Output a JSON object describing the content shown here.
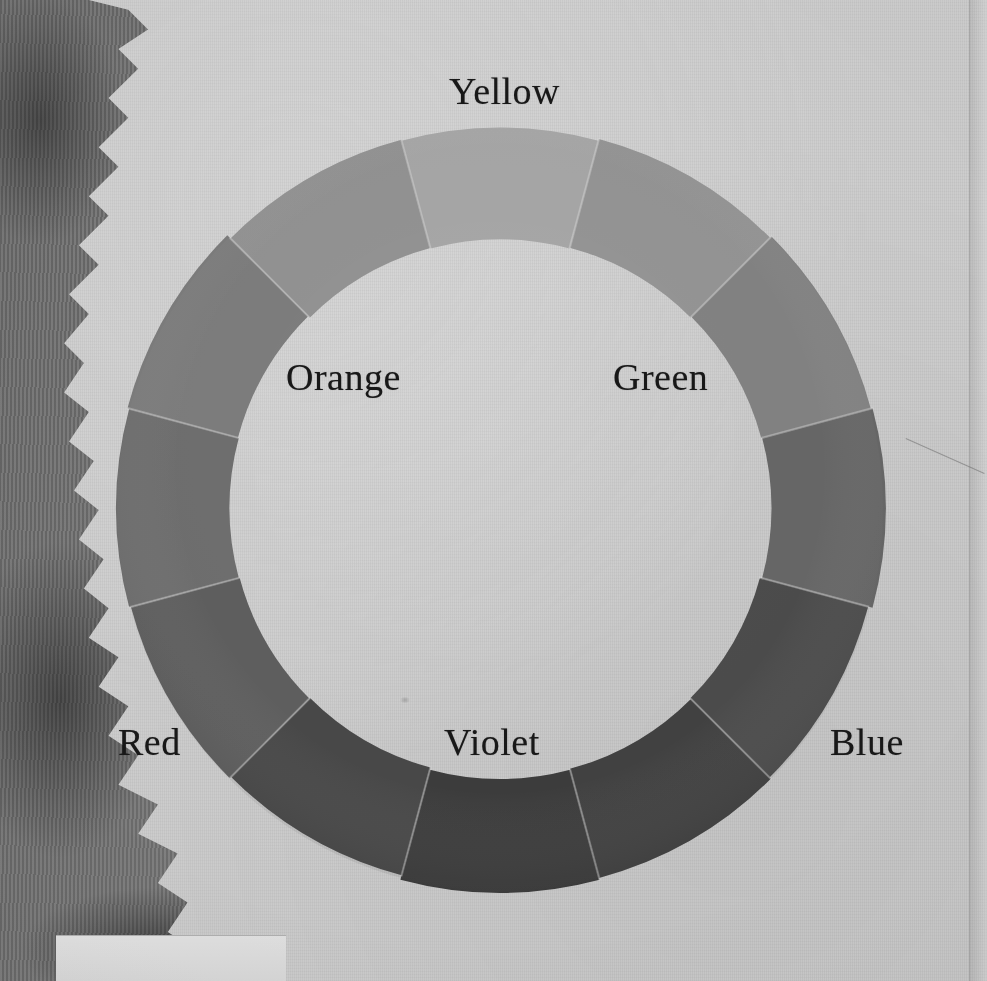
{
  "plate": {
    "title": "Color Wheel",
    "medium": "painted swatch ring on textured paper",
    "paper_color": "#d2d2d2",
    "underlayer_color": "#7a7a7a",
    "ink_color": "#181818"
  },
  "labels": [
    {
      "name": "yellow",
      "text": "Yellow",
      "position": "top"
    },
    {
      "name": "orange",
      "text": "Orange",
      "position": "upper-left"
    },
    {
      "name": "green",
      "text": "Green",
      "position": "upper-right"
    },
    {
      "name": "red",
      "text": "Red",
      "position": "lower-left"
    },
    {
      "name": "violet",
      "text": "Violet",
      "position": "bottom"
    },
    {
      "name": "blue",
      "text": "Blue",
      "position": "lower-right"
    }
  ],
  "chart_data": {
    "type": "pie",
    "xlabel": "",
    "ylabel": "",
    "legend_position": "around-ring",
    "grid": false,
    "note": "Twelve-segment painted colour ring reproduced in greyscale; each slice spans 30 degrees. Values are the sampled grey tone of each swatch (0 = black, 255 = white).",
    "inner_radius": 270,
    "outer_radius": 383,
    "center": [
      500,
      508
    ],
    "categories": [
      "Yellow",
      "Yellow-Green",
      "Green",
      "Blue-Green",
      "Blue",
      "Blue-Violet",
      "Violet",
      "Red-Violet",
      "Red",
      "Red-Orange",
      "Orange",
      "Yellow-Orange"
    ],
    "values": [
      168,
      150,
      132,
      104,
      78,
      66,
      60,
      74,
      96,
      112,
      126,
      148
    ],
    "colors": [
      "#a8a8a8",
      "#969696",
      "#848484",
      "#686868",
      "#4e4e4e",
      "#424242",
      "#3c3c3c",
      "#4a4a4a",
      "#606060",
      "#707070",
      "#7e7e7e",
      "#949494"
    ],
    "start_angle_deg": -15,
    "segment_span_deg": 30,
    "labeled_segments": [
      "Yellow",
      "Green",
      "Blue",
      "Violet",
      "Red",
      "Orange"
    ]
  }
}
